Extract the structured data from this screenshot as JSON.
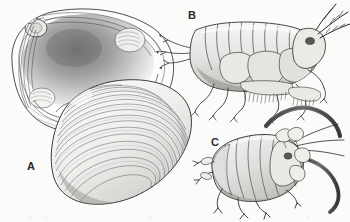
{
  "figure": {
    "kind": "scientific-illustration-plate",
    "medium": "pen-and-ink stipple line drawing",
    "background_color": "#fbfbfa",
    "ink_color": "#2b2b2b",
    "width": 350,
    "height": 222,
    "panel_count": 3
  },
  "labels": {
    "a": "A",
    "b": "B",
    "c": "C"
  },
  "panels": [
    {
      "id": "a",
      "label": "A",
      "subject": "bivalve-clam-shell",
      "description": "Two valves of a clam: upper-left valve shown interior view with hinge, umbo, adductor muscle scars and pallial sinus; lower-right valve shown exterior view with concentric growth rings",
      "views": [
        "interior-valve",
        "exterior-valve"
      ],
      "features": [
        "hinge-teeth",
        "umbo",
        "anterior-adductor-scar",
        "posterior-adductor-scar",
        "pallial-line",
        "pallial-sinus",
        "concentric-growth-rings"
      ],
      "label_position": {
        "x": 27,
        "y": 161
      }
    },
    {
      "id": "b",
      "label": "B",
      "subject": "amphipod-crustacean",
      "description": "Lateral view of a segmented amphipod with head at right, antennae, gnathopods, pereopods, pleopods and uropods at left",
      "orientation": "lateral, head to the right",
      "features": [
        "antenna-1",
        "antenna-2",
        "segmented-pereon",
        "pleon",
        "gnathopods",
        "pereopods",
        "setose-pleopods",
        "uropods",
        "compound-eye"
      ],
      "label_position": {
        "x": 188,
        "y": 10
      }
    },
    {
      "id": "c",
      "label": "C",
      "subject": "isopod-crustacean",
      "description": "Dorsolateral view of an oval segmented isopod with head at right bearing two long curved antennae and short legs",
      "orientation": "dorsolateral, head to the right",
      "features": [
        "long-curved-antennae",
        "segmented-pereonites",
        "pleotelson",
        "short-pereopods",
        "compound-eye"
      ],
      "label_position": {
        "x": 211,
        "y": 137
      }
    }
  ]
}
